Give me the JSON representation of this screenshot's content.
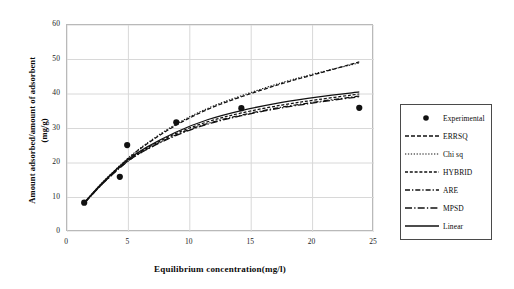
{
  "chart_data": {
    "type": "line",
    "title": "",
    "xlabel": "Equilibrium concentration(mg/l)",
    "ylabel_line1": "Amount adsorbed/amount of adsorbent",
    "ylabel_line2": "(mg/g)",
    "xlim": [
      0,
      25
    ],
    "ylim": [
      0,
      60
    ],
    "xticks": [
      "0",
      "5",
      "10",
      "15",
      "20",
      "25"
    ],
    "yticks": [
      "0",
      "10",
      "20",
      "30",
      "40",
      "50",
      "60"
    ],
    "grid": "both",
    "legend_position": "right-outside",
    "scatter": {
      "name": "Experimental",
      "marker": "filled-circle",
      "points": [
        {
          "x": 1.4,
          "y": 8.5
        },
        {
          "x": 4.3,
          "y": 16.0
        },
        {
          "x": 4.9,
          "y": 25.2
        },
        {
          "x": 8.9,
          "y": 31.8
        },
        {
          "x": 14.2,
          "y": 35.9
        },
        {
          "x": 23.8,
          "y": 36.0
        }
      ]
    },
    "series": [
      {
        "name": "ERRSQ",
        "style": "dashed",
        "x": [
          1.4,
          3.0,
          4.9,
          6.5,
          8.9,
          11.5,
          14.2,
          17.5,
          20.5,
          23.8
        ],
        "values": [
          8.4,
          14.6,
          21.0,
          25.5,
          31.0,
          35.6,
          39.2,
          43.0,
          46.0,
          49.3
        ]
      },
      {
        "name": "Chi sq",
        "style": "dotted",
        "x": [
          1.4,
          3.0,
          4.9,
          6.5,
          8.9,
          11.5,
          14.2,
          17.5,
          20.5,
          23.8
        ],
        "values": [
          8.5,
          14.8,
          21.2,
          25.7,
          31.3,
          35.9,
          39.5,
          43.3,
          46.2,
          49.0
        ]
      },
      {
        "name": "HYBRID",
        "style": "dashed-short",
        "x": [
          1.4,
          3.0,
          4.9,
          6.5,
          8.9,
          11.5,
          14.2,
          17.5,
          20.5,
          23.8
        ],
        "values": [
          8.4,
          14.5,
          20.6,
          24.3,
          28.6,
          32.0,
          34.5,
          36.8,
          38.4,
          40.0
        ]
      },
      {
        "name": "ARE",
        "style": "dash-dot",
        "x": [
          1.4,
          3.0,
          4.9,
          6.5,
          8.9,
          11.5,
          14.2,
          17.5,
          20.5,
          23.8
        ],
        "values": [
          8.3,
          14.4,
          20.4,
          24.0,
          28.2,
          31.5,
          33.9,
          36.2,
          37.8,
          39.4
        ]
      },
      {
        "name": "MPSD",
        "style": "long-dash-dot",
        "x": [
          1.4,
          3.0,
          4.9,
          6.5,
          8.9,
          11.5,
          14.2,
          17.5,
          20.5,
          23.8
        ],
        "values": [
          8.3,
          14.3,
          20.3,
          23.9,
          28.0,
          31.3,
          33.7,
          36.0,
          37.6,
          39.2
        ]
      },
      {
        "name": "Linear",
        "style": "solid",
        "x": [
          1.4,
          3.0,
          4.9,
          6.5,
          8.9,
          11.5,
          14.2,
          17.5,
          20.5,
          23.8
        ],
        "values": [
          8.5,
          14.7,
          20.8,
          24.6,
          29.0,
          32.6,
          35.2,
          37.6,
          39.2,
          40.6
        ]
      }
    ],
    "legend": [
      {
        "label": "Experimental",
        "key": "marker"
      },
      {
        "label": "ERRSQ",
        "key": "dashed"
      },
      {
        "label": "Chi sq",
        "key": "dotted"
      },
      {
        "label": "HYBRID",
        "key": "dashed-short"
      },
      {
        "label": "ARE",
        "key": "dash-dot"
      },
      {
        "label": "MPSD",
        "key": "long-dash-dot"
      },
      {
        "label": "Linear",
        "key": "solid"
      }
    ],
    "colors": {
      "series": "#111111",
      "grid": "#d8d8d8",
      "frame": "#b9b9b9"
    }
  }
}
